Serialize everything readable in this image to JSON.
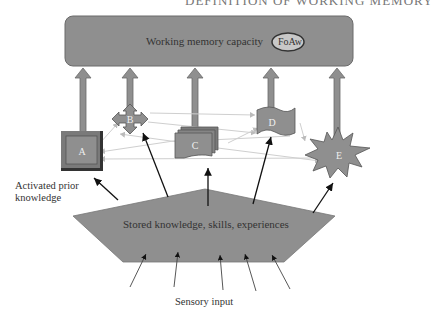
{
  "header": {
    "running_title": "DEFINITION OF WORKING MEMORY"
  },
  "diagram": {
    "top_box": {
      "label": "Working memory capacity",
      "badge": "FoAw"
    },
    "nodes": [
      {
        "id": "A",
        "shape": "beveled-square"
      },
      {
        "id": "B",
        "shape": "four-way-arrow"
      },
      {
        "id": "C",
        "shape": "stacked-documents"
      },
      {
        "id": "D",
        "shape": "wavy-banner"
      },
      {
        "id": "E",
        "shape": "starburst"
      }
    ],
    "base": {
      "label": "Stored knowledge, skills, experiences"
    },
    "side_label": {
      "line1": "Activated prior",
      "line2": "knowledge"
    },
    "bottom_label": "Sensory input",
    "colors": {
      "fill": "#8f8f8f",
      "stroke": "#555555",
      "thin_lines": "#c8c8c8",
      "text": "#333333"
    }
  }
}
